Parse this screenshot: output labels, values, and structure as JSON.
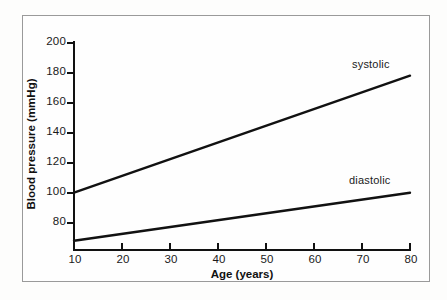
{
  "chart_data": {
    "type": "line",
    "title": "",
    "xlabel": "Age (years)",
    "ylabel": "Blood pressure (mmHg)",
    "xlim": [
      10,
      80
    ],
    "ylim": [
      60,
      200
    ],
    "grid": false,
    "legend_position": "inline-annotation",
    "xticks": [
      10,
      20,
      30,
      40,
      50,
      60,
      70,
      80
    ],
    "yticks": [
      80,
      100,
      120,
      140,
      160,
      180,
      200
    ],
    "xtick_labels": [
      "10",
      "20",
      "30",
      "40",
      "50",
      "60",
      "70",
      "80"
    ],
    "ytick_labels": [
      "80",
      "100",
      "120",
      "140",
      "160",
      "180",
      "200"
    ],
    "x": [
      10,
      80
    ],
    "series": [
      {
        "name": "systolic",
        "label": "systolic",
        "color": "#111111",
        "values": [
          100,
          178
        ]
      },
      {
        "name": "diastolic",
        "label": "diastolic",
        "color": "#111111",
        "values": [
          68,
          100
        ]
      }
    ],
    "annotations": [
      {
        "text": "systolic",
        "x": 66,
        "y": 186
      },
      {
        "text": "diastolic",
        "x": 65,
        "y": 108
      }
    ]
  },
  "figure": {
    "border_color": "#9a9a9a",
    "background": "#fefefe",
    "axis_color": "#111111",
    "line_color": "#111111"
  }
}
